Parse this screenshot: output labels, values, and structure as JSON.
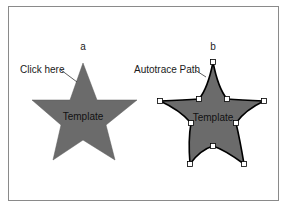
{
  "figure": {
    "panel_a": {
      "label": "a",
      "callout": "Click here",
      "shape_label": "Template",
      "fill_color": "#6b6b6b"
    },
    "panel_b": {
      "label": "b",
      "callout": "Autotrace Path",
      "shape_label": "Template",
      "fill_color": "#6b6b6b",
      "path_color": "#000000",
      "handle_color": "#ffffff"
    },
    "frame_color": "#8a8a8a"
  }
}
